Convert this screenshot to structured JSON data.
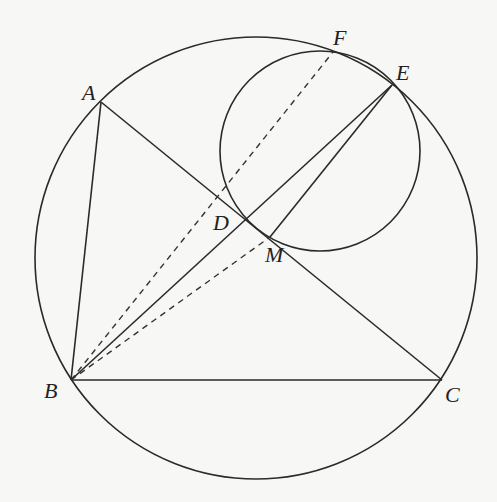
{
  "diagram": {
    "type": "geometry",
    "points": {
      "A": {
        "label": "A",
        "x": 101,
        "y": 102
      },
      "B": {
        "label": "B",
        "x": 71,
        "y": 380
      },
      "C": {
        "label": "C",
        "x": 442,
        "y": 380
      },
      "D": {
        "label": "D",
        "x": 247,
        "y": 220
      },
      "E": {
        "label": "E",
        "x": 392,
        "y": 85
      },
      "F": {
        "label": "F",
        "x": 333,
        "y": 50
      },
      "M": {
        "label": "M",
        "x": 270,
        "y": 237
      }
    },
    "circles": [
      {
        "name": "circumcircle",
        "cx": 256,
        "cy": 258,
        "r": 221
      },
      {
        "name": "small-circle",
        "cx": 320,
        "cy": 151,
        "r": 100
      }
    ],
    "segments_solid": [
      [
        "A",
        "B"
      ],
      [
        "B",
        "C"
      ],
      [
        "A",
        "C"
      ],
      [
        "B",
        "E"
      ],
      [
        "E",
        "M"
      ]
    ],
    "segments_dashed": [
      [
        "B",
        "F"
      ],
      [
        "B",
        "M"
      ]
    ],
    "labels": [
      "A",
      "B",
      "C",
      "D",
      "E",
      "F",
      "M"
    ]
  }
}
